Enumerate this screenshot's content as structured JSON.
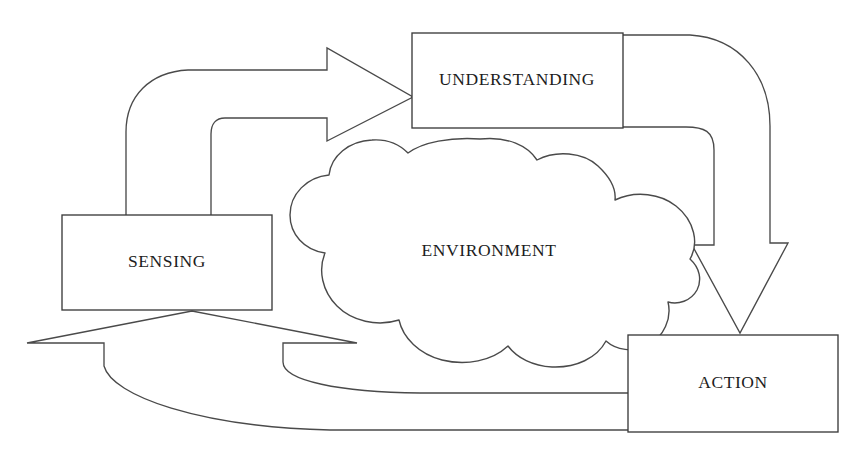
{
  "diagram": {
    "background_color": "#ffffff",
    "line_color": "#3b3b3b",
    "nodes": [
      {
        "id": "sensing",
        "label": "SENSING",
        "shape": "rectangle",
        "x": 62,
        "y": 215,
        "width": 210,
        "height": 95,
        "label_x": 167,
        "label_y": 263
      },
      {
        "id": "understanding",
        "label": "UNDERSTANDING",
        "shape": "rectangle",
        "x": 412,
        "y": 33,
        "width": 211,
        "height": 95,
        "label_x": 517,
        "label_y": 81
      },
      {
        "id": "action",
        "label": "ACTION",
        "shape": "rectangle",
        "x": 628,
        "y": 335,
        "width": 210,
        "height": 97,
        "label_x": 733,
        "label_y": 384
      },
      {
        "id": "environment",
        "label": "ENVIRONMENT",
        "shape": "cloud",
        "x": 290,
        "y": 138,
        "width": 425,
        "height": 227,
        "label_x": 489,
        "label_y": 252
      }
    ],
    "connectors": [
      {
        "id": "sensing-to-understanding",
        "label": "",
        "from": "sensing",
        "to": "understanding",
        "style": "curved-block-arrow",
        "direction": "up-right"
      },
      {
        "id": "understanding-to-action",
        "label": "",
        "from": "understanding",
        "to": "action",
        "style": "curved-block-arrow",
        "direction": "right-down"
      },
      {
        "id": "action-to-sensing",
        "label": "",
        "from": "action",
        "to": "sensing",
        "style": "curved-block-arrow",
        "direction": "left-up"
      }
    ]
  }
}
